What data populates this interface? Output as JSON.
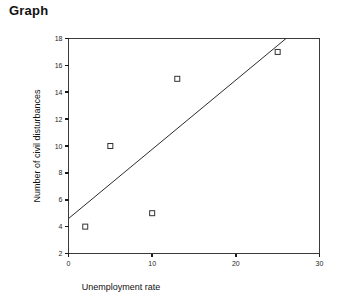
{
  "page": {
    "title": "Graph",
    "background_color": "#ffffff"
  },
  "chart_data": {
    "type": "scatter",
    "title": "Graph",
    "xlabel": "Unemployment rate",
    "ylabel": "Number of civil disturbances",
    "xlim": [
      0,
      30
    ],
    "ylim": [
      2,
      18
    ],
    "xticks": [
      0,
      10,
      20,
      30
    ],
    "yticks": [
      2,
      4,
      6,
      8,
      10,
      12,
      14,
      16,
      18
    ],
    "xtick_labels": [
      "0",
      "10",
      "20",
      "30"
    ],
    "ytick_labels": [
      "2",
      "4",
      "6",
      "8",
      "10",
      "12",
      "14",
      "16",
      "18"
    ],
    "grid": false,
    "legend": null,
    "marker_style": "open-square",
    "marker_fill": "#ffffff",
    "marker_edge_color": "#333333",
    "points": [
      {
        "x": 2,
        "y": 4
      },
      {
        "x": 5,
        "y": 10
      },
      {
        "x": 10,
        "y": 5
      },
      {
        "x": 13,
        "y": 15
      },
      {
        "x": 25,
        "y": 17
      }
    ],
    "trendline": {
      "type": "line",
      "color": "#2b2b2b",
      "x_start": 0,
      "y_start": 4.6,
      "x_end": 26.0,
      "y_end": 18.0
    }
  }
}
